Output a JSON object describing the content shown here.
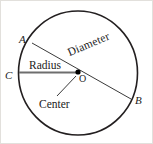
{
  "figure": {
    "canvas": {
      "width": 153,
      "height": 144,
      "background": "#ffffff"
    },
    "colors": {
      "circle_stroke": "#231f20",
      "line_stroke": "#3a3a3a",
      "radius_stroke": "#6e6e6e",
      "center_dot": "#000000",
      "text": "#1b1b1b",
      "frame": "#e2e0dc"
    },
    "circle": {
      "cx": 78,
      "cy": 73,
      "r": 61,
      "stroke_width": 1.6
    },
    "center_point": {
      "x": 78,
      "y": 72,
      "dot_radius": 2.6
    },
    "diameter_line": {
      "x1": 32,
      "y1": 43,
      "x2": 131,
      "y2": 99,
      "stroke_width": 1
    },
    "radius_line": {
      "x1": 19,
      "y1": 72,
      "x2": 78,
      "y2": 72,
      "stroke_width": 1.6
    },
    "leader_line": {
      "x1": 58,
      "y1": 97,
      "x2": 76,
      "y2": 76,
      "stroke_width": 1
    },
    "labels": {
      "point_a": "A",
      "point_b": "B",
      "point_c": "C",
      "point_o": "O",
      "radius": "Radius",
      "diameter": "Diameter",
      "center": "Center"
    }
  }
}
